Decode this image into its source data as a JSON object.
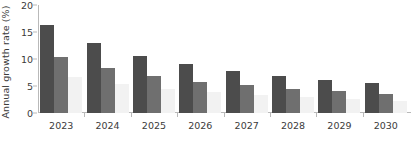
{
  "chart_data": {
    "type": "bar",
    "title": "",
    "subtitle": "",
    "xlabel": "",
    "ylabel": "Annual growth rate (%)",
    "categories": [
      "2023",
      "2024",
      "2025",
      "2026",
      "2027",
      "2028",
      "2029",
      "2030"
    ],
    "series": [
      {
        "name": "series-1",
        "color": "#4c4c4c",
        "values": [
          16.3,
          12.9,
          10.6,
          9.0,
          7.8,
          6.9,
          6.2,
          5.5
        ]
      },
      {
        "name": "series-2",
        "color": "#6f6f6f",
        "values": [
          10.4,
          8.3,
          6.8,
          5.8,
          5.1,
          4.5,
          4.0,
          3.5
        ]
      },
      {
        "name": "series-3",
        "color": "#f2f2f2",
        "values": [
          6.7,
          5.3,
          4.4,
          3.8,
          3.3,
          2.9,
          2.6,
          2.3
        ]
      }
    ],
    "ylim": [
      0,
      20
    ],
    "yticks": [
      0,
      5,
      10,
      15,
      20
    ],
    "ytick_labels": [
      "0",
      "5",
      "10",
      "15",
      "20"
    ],
    "grid": false,
    "legend": "none"
  }
}
